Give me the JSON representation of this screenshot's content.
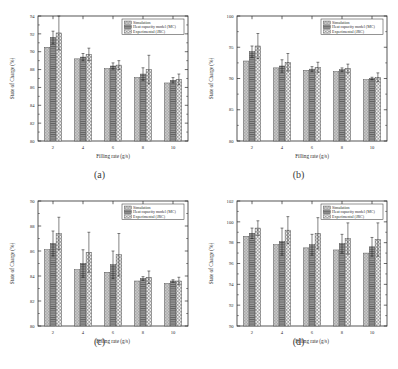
{
  "figure": {
    "panels": [
      {
        "caption": "(a)",
        "xlabel": "Filling rate (g/s)",
        "ylabel": "State of Charge (%)",
        "legend": [
          "Simulation",
          "Heat capacity model (MC)",
          "Experimental (JRC)"
        ],
        "chart_data": {
          "type": "bar",
          "title": "",
          "xlabel": "Filling rate (g/s)",
          "ylabel": "State of Charge (%)",
          "categories": [
            "2",
            "4",
            "6",
            "8",
            "10"
          ],
          "xticklabels": [
            "2",
            "4",
            "6",
            "8",
            "10"
          ],
          "yticklabels": [
            "80",
            "82",
            "84",
            "86",
            "88",
            "90",
            "92",
            "94"
          ],
          "ylim": [
            80,
            94
          ],
          "yticks": [
            80,
            82,
            84,
            86,
            88,
            90,
            92,
            94
          ],
          "grid": false,
          "legend_position": "upper right",
          "series": [
            {
              "name": "Simulation",
              "values": [
                90.5,
                89.2,
                88.1,
                87.1,
                86.5
              ],
              "errors": [
                0,
                0,
                0,
                0,
                0
              ]
            },
            {
              "name": "Heat capacity model (MC)",
              "values": [
                91.6,
                89.4,
                88.4,
                87.5,
                86.8
              ],
              "errors": [
                0.7,
                0.4,
                0.35,
                0.7,
                0.3
              ]
            },
            {
              "name": "Experimental (JRC)",
              "values": [
                92.1,
                89.7,
                88.5,
                88.0,
                86.9
              ],
              "errors": [
                1.9,
                0.7,
                0.5,
                1.6,
                0.6
              ]
            }
          ]
        }
      },
      {
        "caption": "(b)",
        "xlabel": "Filling rate (g/s)",
        "ylabel": "State of Charge (%)",
        "legend": [
          "Simulation",
          "Heat capacity model (MC)",
          "Experimental (JRC)"
        ],
        "chart_data": {
          "type": "bar",
          "title": "",
          "xlabel": "Filling rate (g/s)",
          "ylabel": "State of Charge (%)",
          "categories": [
            "2",
            "4",
            "6",
            "8",
            "10"
          ],
          "xticklabels": [
            "2",
            "4",
            "6",
            "8",
            "10"
          ],
          "yticklabels": [
            "80",
            "85",
            "90",
            "95",
            "100"
          ],
          "ylim": [
            80,
            100
          ],
          "yticks": [
            80,
            85,
            90,
            95,
            100
          ],
          "grid": false,
          "legend_position": "upper right",
          "series": [
            {
              "name": "Simulation",
              "values": [
                92.8,
                91.7,
                91.3,
                91.1,
                89.8
              ],
              "errors": [
                0,
                0,
                0,
                0,
                0
              ]
            },
            {
              "name": "Heat capacity model (MC)",
              "values": [
                94.3,
                92.0,
                91.5,
                91.4,
                90.0
              ],
              "errors": [
                0.9,
                1.0,
                0.4,
                0.3,
                0.2
              ]
            },
            {
              "name": "Experimental (JRC)",
              "values": [
                95.2,
                92.6,
                91.8,
                91.6,
                90.2
              ],
              "errors": [
                2.0,
                1.4,
                0.8,
                0.7,
                0.7
              ]
            }
          ]
        }
      },
      {
        "caption": "(c)",
        "xlabel": "Filling rate (g/s)",
        "ylabel": "State of Charge (%)",
        "legend": [
          "Simulation",
          "Heat capacity model (MC)",
          "Experimental (JRC)"
        ],
        "chart_data": {
          "type": "bar",
          "title": "",
          "xlabel": "Filling rate (g/s)",
          "ylabel": "State of Charge (%)",
          "categories": [
            "2",
            "4",
            "6",
            "8",
            "10"
          ],
          "xticklabels": [
            "2",
            "4",
            "6",
            "8",
            "10"
          ],
          "yticklabels": [
            "80",
            "82",
            "84",
            "86",
            "88",
            "90"
          ],
          "ylim": [
            80,
            90
          ],
          "yticks": [
            80,
            82,
            84,
            86,
            88,
            90
          ],
          "grid": false,
          "legend_position": "upper right",
          "series": [
            {
              "name": "Simulation",
              "values": [
                86.1,
                84.5,
                84.3,
                83.6,
                83.4
              ],
              "errors": [
                0,
                0,
                0,
                0,
                0
              ]
            },
            {
              "name": "Heat capacity model (MC)",
              "values": [
                86.6,
                85.0,
                84.9,
                83.8,
                83.6
              ],
              "errors": [
                1.0,
                1.1,
                1.1,
                0.15,
                0.1
              ]
            },
            {
              "name": "Experimental (JRC)",
              "values": [
                87.4,
                85.9,
                85.7,
                83.9,
                83.6
              ],
              "errors": [
                1.3,
                1.6,
                1.7,
                0.5,
                0.3
              ]
            }
          ]
        }
      },
      {
        "caption": "(d)",
        "xlabel": "Filling rate (g/s)",
        "ylabel": "State of Charge (%)",
        "legend": [
          "Simulation",
          "Heat capacity model (MC)",
          "Experimental (JRC)"
        ],
        "chart_data": {
          "type": "bar",
          "title": "",
          "xlabel": "Filling rate (g/s)",
          "ylabel": "State of Charge (%)",
          "categories": [
            "2",
            "4",
            "6",
            "8",
            "10"
          ],
          "xticklabels": [
            "2",
            "4",
            "6",
            "8",
            "10"
          ],
          "yticklabels": [
            "90",
            "92",
            "94",
            "96",
            "98",
            "100",
            "102"
          ],
          "ylim": [
            90,
            102
          ],
          "yticks": [
            90,
            92,
            94,
            96,
            98,
            100,
            102
          ],
          "grid": false,
          "legend_position": "upper right",
          "series": [
            {
              "name": "Simulation",
              "values": [
                98.6,
                97.8,
                97.5,
                97.3,
                97.0
              ],
              "errors": [
                0,
                0,
                0,
                0,
                0
              ]
            },
            {
              "name": "Heat capacity model (MC)",
              "values": [
                98.9,
                98.1,
                97.8,
                97.9,
                97.6
              ],
              "errors": [
                0.5,
                1.3,
                1.0,
                0.9,
                0.9
              ]
            },
            {
              "name": "Experimental (JRC)",
              "values": [
                99.4,
                99.2,
                98.9,
                98.4,
                98.3
              ],
              "errors": [
                0.7,
                1.3,
                1.5,
                1.5,
                1.6
              ]
            }
          ]
        }
      }
    ]
  },
  "style": {
    "axis_color": "#2b2b2b",
    "series_colors": [
      "#b8b8b8",
      "#8e8e8e",
      "#d8d8d8"
    ],
    "error_color": "#1c1c1c"
  }
}
